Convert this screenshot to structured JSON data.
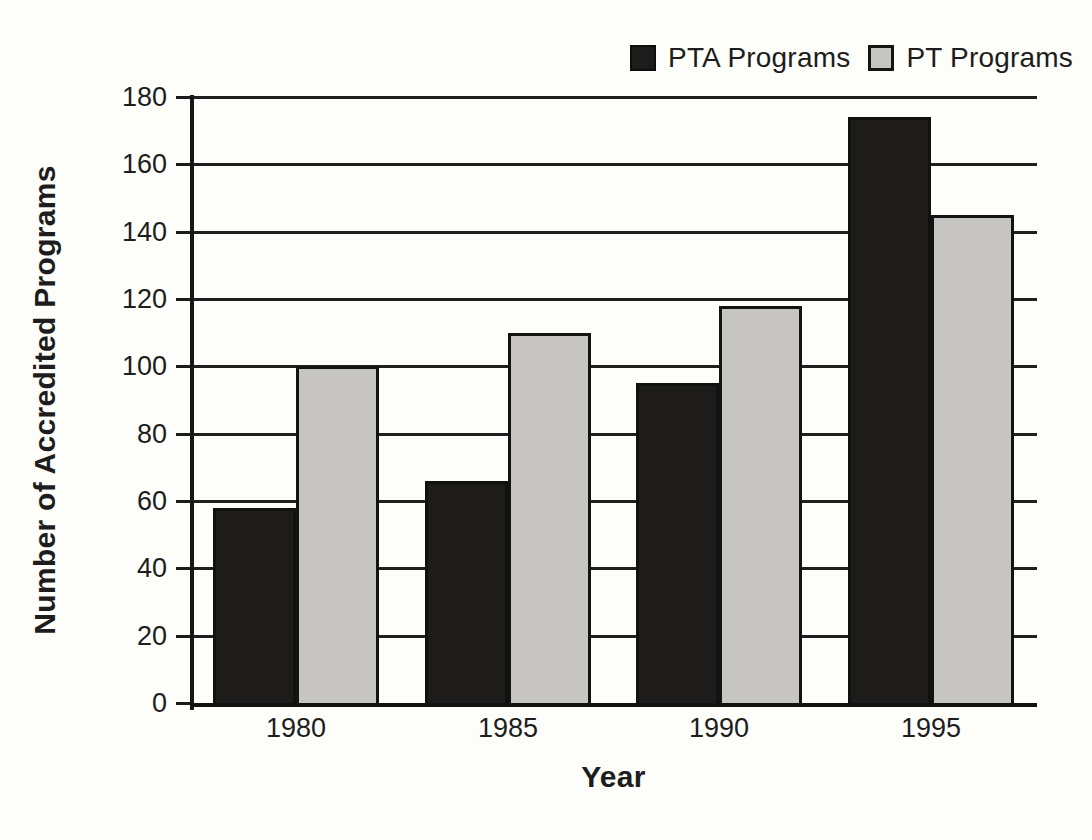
{
  "chart_data": {
    "type": "bar",
    "categories": [
      "1980",
      "1985",
      "1990",
      "1995"
    ],
    "series": [
      {
        "name": "PTA Programs",
        "color": "#1d1c1a",
        "values": [
          58,
          66,
          95,
          174
        ]
      },
      {
        "name": "PT Programs",
        "color": "#c7c5c1",
        "values": [
          100,
          110,
          118,
          145
        ]
      }
    ],
    "xlabel": "Year",
    "ylabel": "Number of Accredited Programs",
    "ylim": [
      0,
      180
    ],
    "yticks": [
      0,
      20,
      40,
      60,
      80,
      100,
      120,
      140,
      160,
      180
    ],
    "grid": "horizontal",
    "legend_position": "top-right"
  },
  "colors": {
    "pta_bar": "#1d1c1a",
    "pt_bar": "#c7c5c1",
    "line": "#1f1f1f",
    "text": "#1d1d1d",
    "paper": "#fdfdfa"
  }
}
